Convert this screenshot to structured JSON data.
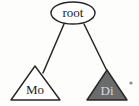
{
  "diagram": {
    "type": "tree",
    "background_color": "#fdfdfc",
    "stroke_color": "#262626",
    "nodes": [
      {
        "id": "root",
        "label": "root",
        "shape": "ellipse",
        "fill": "#ffffff",
        "text_color": "#1d1d1d",
        "cx": 73,
        "cy": 13,
        "rx": 22,
        "ry": 11
      },
      {
        "id": "mo",
        "label": "Mo",
        "shape": "triangle",
        "fill": "#ffffff",
        "text_color": "#1d1d1d",
        "apex_x": 35,
        "apex_y": 66,
        "base_left_x": 11,
        "base_right_x": 60,
        "base_y": 100,
        "label_x": 35,
        "label_y": 91
      },
      {
        "id": "di",
        "label": "Di",
        "shape": "triangle",
        "fill": "#6b6b6b",
        "text_color": "#d9d9d9",
        "apex_x": 107,
        "apex_y": 70,
        "base_left_x": 87,
        "base_right_x": 127,
        "base_y": 100,
        "label_x": 107,
        "label_y": 92
      }
    ],
    "edges": [
      {
        "id": "root-to-mo",
        "from": "root",
        "to": "mo",
        "x1": 64,
        "y1": 24,
        "x2": 43,
        "y2": 73
      },
      {
        "id": "root-to-di",
        "from": "root",
        "to": "di",
        "x1": 84,
        "y1": 24,
        "x2": 107,
        "y2": 71
      }
    ],
    "artifacts": [
      {
        "id": "speck",
        "kind": "scan-speck",
        "cx": 131,
        "cy": 83,
        "r": 1.6,
        "color": "#8a8a8a"
      }
    ]
  }
}
